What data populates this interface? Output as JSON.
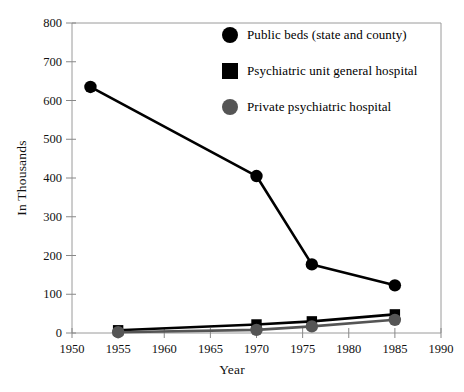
{
  "chart_data": {
    "type": "line",
    "title": "",
    "xlabel": "Year",
    "ylabel": "In Thousands",
    "xlim": [
      1950,
      1990
    ],
    "ylim": [
      0,
      800
    ],
    "xticks": [
      1950,
      1955,
      1960,
      1965,
      1970,
      1975,
      1980,
      1985,
      1990
    ],
    "yticks": [
      0,
      100,
      200,
      300,
      400,
      500,
      600,
      700,
      800
    ],
    "grid": false,
    "legend_position": "top-right",
    "series": [
      {
        "name": "Public beds (state and county)",
        "marker": "circle",
        "color": "#000000",
        "points": [
          {
            "x": 1952,
            "y": 635
          },
          {
            "x": 1970,
            "y": 405
          },
          {
            "x": 1976,
            "y": 177
          },
          {
            "x": 1985,
            "y": 123
          }
        ]
      },
      {
        "name": "Psychiatric unit general hospital",
        "marker": "square",
        "color": "#000000",
        "points": [
          {
            "x": 1955,
            "y": 7
          },
          {
            "x": 1970,
            "y": 22
          },
          {
            "x": 1976,
            "y": 30
          },
          {
            "x": 1985,
            "y": 48
          }
        ]
      },
      {
        "name": "Private psychiatric hospital",
        "marker": "circle",
        "color": "#555555",
        "points": [
          {
            "x": 1955,
            "y": 2
          },
          {
            "x": 1970,
            "y": 8
          },
          {
            "x": 1976,
            "y": 17
          },
          {
            "x": 1985,
            "y": 34
          }
        ]
      }
    ]
  },
  "legend": {
    "items": [
      {
        "label": "Public beds (state and county)",
        "marker": "circle",
        "color": "#000000"
      },
      {
        "label": "Psychiatric unit general hospital",
        "marker": "square",
        "color": "#000000"
      },
      {
        "label": "Private psychiatric hospital",
        "marker": "circle",
        "color": "#555555"
      }
    ]
  },
  "colors": {
    "axis": "#888888",
    "frame": "#9a9a9a",
    "series_black": "#000000",
    "series_gray": "#555555",
    "background": "#ffffff"
  }
}
